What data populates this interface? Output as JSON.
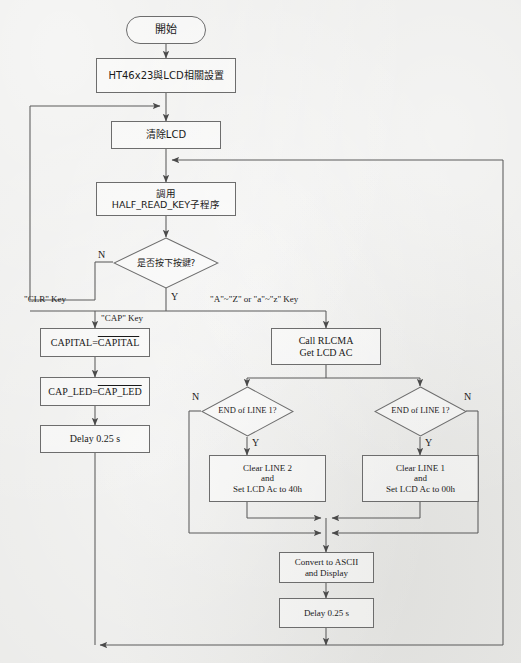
{
  "document": {
    "type": "flowchart",
    "language": "zh-TW / en",
    "background_color": "#eaeae8",
    "line_color": "#5a5a5a",
    "text_color": "#1a1a1a"
  },
  "nodes": {
    "start": {
      "label": "開始",
      "shape": "terminator"
    },
    "init": {
      "label": "HT46x23與LCD相關設置",
      "shape": "process"
    },
    "clear_lcd": {
      "label": "清除LCD",
      "shape": "process"
    },
    "call_key": {
      "line1": "調用",
      "line2": "HALF_READ_KEY子程序",
      "shape": "process"
    },
    "key_pressed": {
      "label": "是否按下按鍵?",
      "shape": "decision"
    },
    "capital_toggle": {
      "prefix": "CAPITAL=",
      "overline": "CAPITAL",
      "shape": "process"
    },
    "cap_led_toggle": {
      "prefix": "CAP_LED=",
      "overline": "CAP_LED",
      "shape": "process"
    },
    "delay_left": {
      "label": "Delay 0.25 s",
      "shape": "process"
    },
    "call_rlcma": {
      "line1": "Call RLCMA",
      "line2": "Get LCD AC",
      "shape": "process"
    },
    "end_line_left": {
      "label": "END of LINE 1?",
      "shape": "decision"
    },
    "end_line_right": {
      "label": "END of LINE 1?",
      "shape": "decision"
    },
    "clear_line2": {
      "line1": "Clear LINE 2",
      "line2": "and",
      "line3": "Set LCD Ac to 40h",
      "shape": "process"
    },
    "clear_line1": {
      "line1": "Clear LINE 1",
      "line2": "and",
      "line3": "Set LCD Ac to 00h",
      "shape": "process"
    },
    "convert_ascii": {
      "line1": "Convert to ASCII",
      "line2": "and Display",
      "shape": "process"
    },
    "delay_bottom": {
      "label": "Delay 0.25 s",
      "shape": "process"
    }
  },
  "edge_labels": {
    "no_key": "N",
    "yes_key": "Y",
    "clr_key": "\"CLR\" Key",
    "cap_key": "\"CAP\" Key",
    "az_key": "\"A\"~\"Z\" or \"a\"~\"z\" Key",
    "n_left": "N",
    "y_left": "Y",
    "n_right": "N",
    "y_right": "Y"
  }
}
